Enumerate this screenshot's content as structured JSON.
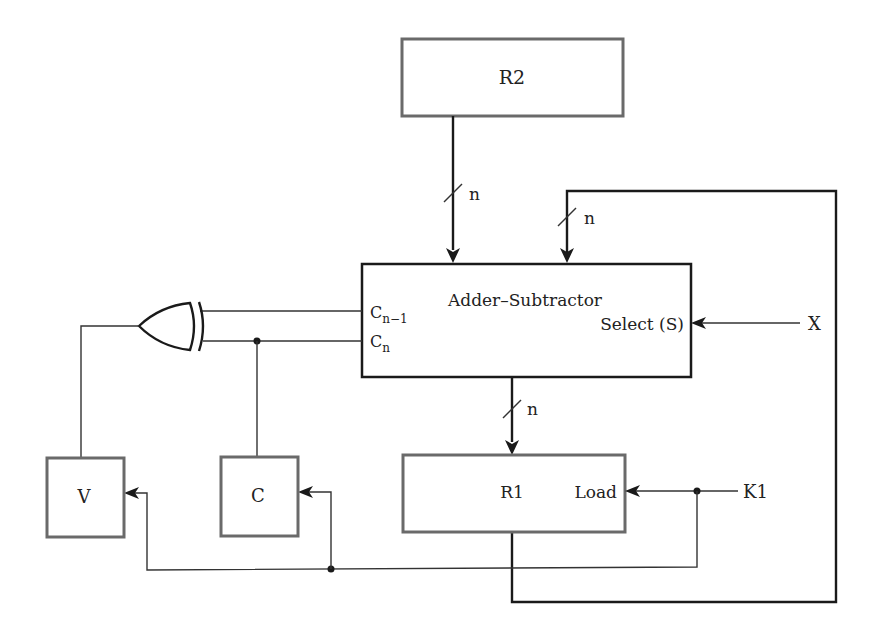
{
  "diagram": {
    "type": "block-diagram",
    "blocks": {
      "r2": {
        "label": "R2"
      },
      "adder": {
        "label": "Adder–Subtractor",
        "port_cn1_main": "C",
        "port_cn1_sub": "n−1",
        "port_cn_main": "C",
        "port_cn_sub": "n",
        "port_select": "Select (S)"
      },
      "r1": {
        "label": "R1",
        "port_load": "Load"
      },
      "v": {
        "label": "V"
      },
      "c": {
        "label": "C"
      }
    },
    "gates": {
      "xor": {
        "type": "XOR"
      }
    },
    "bus_widths": {
      "r2_to_adder": "n",
      "feedback_to_adder": "n",
      "adder_to_r1": "n"
    },
    "signals": {
      "x": "X",
      "k1": "K1"
    },
    "colors": {
      "line": "#1a1a1a",
      "box_border": "#6a6a6a",
      "background": "#ffffff"
    }
  }
}
